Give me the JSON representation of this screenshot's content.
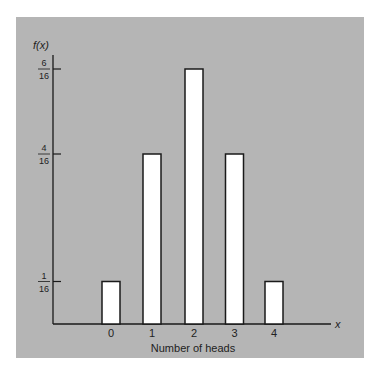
{
  "chart_data": {
    "type": "bar",
    "title": "",
    "xlabel": "Number of heads",
    "ylabel": "f(x)",
    "x_axis_symbol": "x",
    "categories": [
      "0",
      "1",
      "2",
      "3",
      "4"
    ],
    "values": [
      0.0625,
      0.25,
      0.375,
      0.25,
      0.0625
    ],
    "values_fraction": [
      "1/16",
      "4/16",
      "6/16",
      "4/16",
      "1/16"
    ],
    "y_ticks": [
      {
        "value": 0.0625,
        "num": "1",
        "den": "16"
      },
      {
        "value": 0.25,
        "num": "4",
        "den": "16"
      },
      {
        "value": 0.375,
        "num": "6",
        "den": "16"
      }
    ],
    "ylim": [
      0,
      0.42
    ],
    "grid": false,
    "legend": null
  },
  "colors": {
    "background": "#b5b5b5",
    "bar_fill": "#ffffff",
    "bar_stroke": "#1a1a1a",
    "axis": "#1a1a1a"
  }
}
